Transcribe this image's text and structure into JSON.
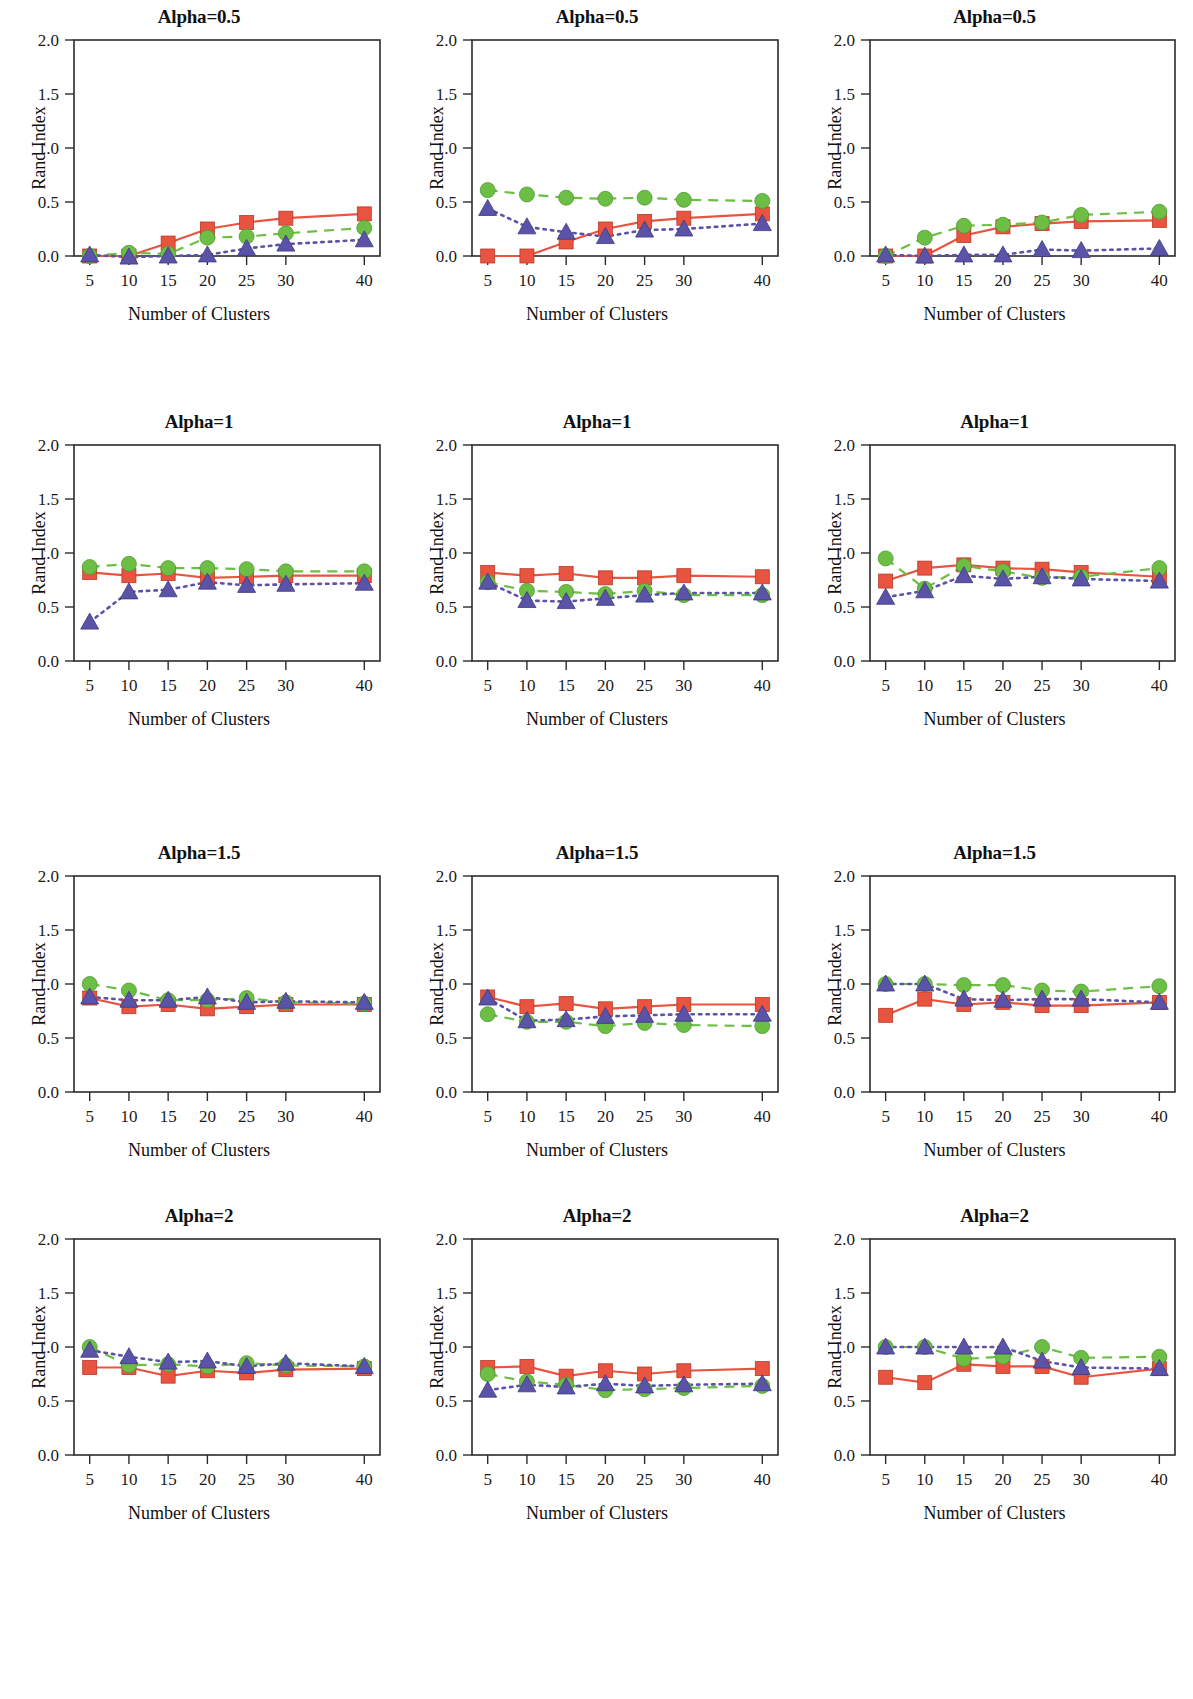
{
  "figure": {
    "axis": {
      "xlabel": "Number of Clusters",
      "ylabel": "Rand Index",
      "x_ticks": [
        "5",
        "10",
        "15",
        "20",
        "25",
        "30",
        "40"
      ],
      "y_ticks": [
        "0.0",
        "0.5",
        "1.0",
        "1.5",
        "2.0"
      ],
      "xlim": [
        3,
        42
      ],
      "ylim": [
        0.0,
        2.0
      ]
    },
    "series_style": {
      "orange": {
        "name": "orange-square-series",
        "color": "#E8543F",
        "marker": "square",
        "line": "solid"
      },
      "green": {
        "name": "green-circle-series",
        "color": "#6DBE45",
        "marker": "circle",
        "line": "dashed"
      },
      "blue": {
        "name": "blue-triangle-series",
        "color": "#5A53A8",
        "marker": "triangle",
        "line": "dotted"
      }
    }
  },
  "chart_data": [
    {
      "id": "r1c1",
      "type": "line",
      "title": "Alpha=0.5",
      "xlabel": "Number of Clusters",
      "ylabel": "Rand Index",
      "x": [
        5,
        10,
        15,
        20,
        25,
        30,
        40
      ],
      "xlim": [
        3,
        42
      ],
      "ylim": [
        0.0,
        2.0
      ],
      "grid": false,
      "legend": "none",
      "series": [
        {
          "name": "orange",
          "values": [
            0.0,
            0.0,
            0.12,
            0.25,
            0.31,
            0.35,
            0.39
          ]
        },
        {
          "name": "green",
          "values": [
            0.0,
            0.03,
            0.02,
            0.17,
            0.18,
            0.21,
            0.26
          ]
        },
        {
          "name": "blue",
          "values": [
            0.01,
            -0.01,
            0.0,
            0.01,
            0.07,
            0.11,
            0.15
          ]
        }
      ]
    },
    {
      "id": "r1c2",
      "type": "line",
      "title": "Alpha=0.5",
      "xlabel": "Number of Clusters",
      "ylabel": "Rand Index",
      "x": [
        5,
        10,
        15,
        20,
        25,
        30,
        40
      ],
      "xlim": [
        3,
        42
      ],
      "ylim": [
        0.0,
        2.0
      ],
      "grid": false,
      "legend": "none",
      "series": [
        {
          "name": "orange",
          "values": [
            0.0,
            0.0,
            0.13,
            0.25,
            0.32,
            0.35,
            0.39
          ]
        },
        {
          "name": "green",
          "values": [
            0.61,
            0.57,
            0.54,
            0.53,
            0.54,
            0.52,
            0.51
          ]
        },
        {
          "name": "blue",
          "values": [
            0.44,
            0.27,
            0.22,
            0.18,
            0.24,
            0.25,
            0.3
          ]
        }
      ]
    },
    {
      "id": "r1c3",
      "type": "line",
      "title": "Alpha=0.5",
      "xlabel": "Number of Clusters",
      "ylabel": "Rand Index",
      "x": [
        5,
        10,
        15,
        20,
        25,
        30,
        40
      ],
      "xlim": [
        3,
        42
      ],
      "ylim": [
        0.0,
        2.0
      ],
      "grid": false,
      "legend": "none",
      "series": [
        {
          "name": "orange",
          "values": [
            0.0,
            0.0,
            0.19,
            0.27,
            0.3,
            0.32,
            0.33
          ]
        },
        {
          "name": "green",
          "values": [
            0.0,
            0.17,
            0.28,
            0.29,
            0.31,
            0.38,
            0.41
          ]
        },
        {
          "name": "blue",
          "values": [
            0.01,
            0.0,
            0.01,
            0.01,
            0.06,
            0.05,
            0.07
          ]
        }
      ]
    },
    {
      "id": "r2c1",
      "type": "line",
      "title": "Alpha=1",
      "xlabel": "Number of Clusters",
      "ylabel": "Rand Index",
      "x": [
        5,
        10,
        15,
        20,
        25,
        30,
        40
      ],
      "xlim": [
        3,
        42
      ],
      "ylim": [
        0.0,
        2.0
      ],
      "grid": false,
      "legend": "none",
      "series": [
        {
          "name": "orange",
          "values": [
            0.82,
            0.79,
            0.81,
            0.77,
            0.78,
            0.79,
            0.79
          ]
        },
        {
          "name": "green",
          "values": [
            0.87,
            0.9,
            0.86,
            0.86,
            0.85,
            0.83,
            0.83
          ]
        },
        {
          "name": "blue",
          "values": [
            0.36,
            0.64,
            0.66,
            0.73,
            0.7,
            0.71,
            0.72
          ]
        }
      ]
    },
    {
      "id": "r2c2",
      "type": "line",
      "title": "Alpha=1",
      "xlabel": "Number of Clusters",
      "ylabel": "Rand Index",
      "x": [
        5,
        10,
        15,
        20,
        25,
        30,
        40
      ],
      "xlim": [
        3,
        42
      ],
      "ylim": [
        0.0,
        2.0
      ],
      "grid": false,
      "legend": "none",
      "series": [
        {
          "name": "orange",
          "values": [
            0.82,
            0.79,
            0.81,
            0.77,
            0.77,
            0.79,
            0.78
          ]
        },
        {
          "name": "green",
          "values": [
            0.73,
            0.65,
            0.64,
            0.62,
            0.65,
            0.61,
            0.61
          ]
        },
        {
          "name": "blue",
          "values": [
            0.73,
            0.56,
            0.55,
            0.58,
            0.61,
            0.63,
            0.63
          ]
        }
      ]
    },
    {
      "id": "r2c3",
      "type": "line",
      "title": "Alpha=1",
      "xlabel": "Number of Clusters",
      "ylabel": "Rand Index",
      "x": [
        5,
        10,
        15,
        20,
        25,
        30,
        40
      ],
      "xlim": [
        3,
        42
      ],
      "ylim": [
        0.0,
        2.0
      ],
      "grid": false,
      "legend": "none",
      "series": [
        {
          "name": "orange",
          "values": [
            0.74,
            0.86,
            0.89,
            0.86,
            0.85,
            0.82,
            0.78
          ]
        },
        {
          "name": "green",
          "values": [
            0.95,
            0.67,
            0.88,
            0.83,
            0.77,
            0.78,
            0.86
          ]
        },
        {
          "name": "blue",
          "values": [
            0.59,
            0.65,
            0.79,
            0.76,
            0.78,
            0.76,
            0.74
          ]
        }
      ]
    },
    {
      "id": "r3c1",
      "type": "line",
      "title": "Alpha=1.5",
      "xlabel": "Number of Clusters",
      "ylabel": "Rand Index",
      "x": [
        5,
        10,
        15,
        20,
        25,
        30,
        40
      ],
      "xlim": [
        3,
        42
      ],
      "ylim": [
        0.0,
        2.0
      ],
      "grid": false,
      "legend": "none",
      "series": [
        {
          "name": "orange",
          "values": [
            0.87,
            0.79,
            0.81,
            0.77,
            0.79,
            0.81,
            0.81
          ]
        },
        {
          "name": "green",
          "values": [
            1.0,
            0.94,
            0.85,
            0.85,
            0.87,
            0.83,
            0.82
          ]
        },
        {
          "name": "blue",
          "values": [
            0.88,
            0.85,
            0.85,
            0.88,
            0.83,
            0.84,
            0.83
          ]
        }
      ]
    },
    {
      "id": "r3c2",
      "type": "line",
      "title": "Alpha=1.5",
      "xlabel": "Number of Clusters",
      "ylabel": "Rand Index",
      "x": [
        5,
        10,
        15,
        20,
        25,
        30,
        40
      ],
      "xlim": [
        3,
        42
      ],
      "ylim": [
        0.0,
        2.0
      ],
      "grid": false,
      "legend": "none",
      "series": [
        {
          "name": "orange",
          "values": [
            0.88,
            0.79,
            0.82,
            0.77,
            0.79,
            0.81,
            0.81
          ]
        },
        {
          "name": "green",
          "values": [
            0.72,
            0.65,
            0.65,
            0.61,
            0.64,
            0.62,
            0.61
          ]
        },
        {
          "name": "blue",
          "values": [
            0.87,
            0.66,
            0.67,
            0.7,
            0.71,
            0.72,
            0.72
          ]
        }
      ]
    },
    {
      "id": "r3c3",
      "type": "line",
      "title": "Alpha=1.5",
      "xlabel": "Number of Clusters",
      "ylabel": "Rand Index",
      "x": [
        5,
        10,
        15,
        20,
        25,
        30,
        40
      ],
      "xlim": [
        3,
        42
      ],
      "ylim": [
        0.0,
        2.0
      ],
      "grid": false,
      "legend": "none",
      "series": [
        {
          "name": "orange",
          "values": [
            0.71,
            0.86,
            0.81,
            0.83,
            0.8,
            0.8,
            0.83
          ]
        },
        {
          "name": "green",
          "values": [
            1.0,
            1.0,
            0.99,
            0.99,
            0.94,
            0.93,
            0.98
          ]
        },
        {
          "name": "blue",
          "values": [
            1.0,
            1.0,
            0.86,
            0.85,
            0.86,
            0.86,
            0.83
          ]
        }
      ]
    },
    {
      "id": "r4c1",
      "type": "line",
      "title": "Alpha=2",
      "xlabel": "Number of Clusters",
      "ylabel": "Rand Index",
      "x": [
        5,
        10,
        15,
        20,
        25,
        30,
        40
      ],
      "xlim": [
        3,
        42
      ],
      "ylim": [
        0.0,
        2.0
      ],
      "grid": false,
      "legend": "none",
      "series": [
        {
          "name": "orange",
          "values": [
            0.81,
            0.81,
            0.73,
            0.78,
            0.76,
            0.79,
            0.8
          ]
        },
        {
          "name": "green",
          "values": [
            1.0,
            0.83,
            0.84,
            0.82,
            0.85,
            0.83,
            0.82
          ]
        },
        {
          "name": "blue",
          "values": [
            0.97,
            0.91,
            0.86,
            0.87,
            0.82,
            0.85,
            0.82
          ]
        }
      ]
    },
    {
      "id": "r4c2",
      "type": "line",
      "title": "Alpha=2",
      "xlabel": "Number of Clusters",
      "ylabel": "Rand Index",
      "x": [
        5,
        10,
        15,
        20,
        25,
        30,
        40
      ],
      "xlim": [
        3,
        42
      ],
      "ylim": [
        0.0,
        2.0
      ],
      "grid": false,
      "legend": "none",
      "series": [
        {
          "name": "orange",
          "values": [
            0.81,
            0.82,
            0.73,
            0.78,
            0.75,
            0.78,
            0.8
          ]
        },
        {
          "name": "green",
          "values": [
            0.75,
            0.68,
            0.65,
            0.6,
            0.61,
            0.62,
            0.64
          ]
        },
        {
          "name": "blue",
          "values": [
            0.6,
            0.65,
            0.63,
            0.66,
            0.64,
            0.65,
            0.66
          ]
        }
      ]
    },
    {
      "id": "r4c3",
      "type": "line",
      "title": "Alpha=2",
      "xlabel": "Number of Clusters",
      "ylabel": "Rand Index",
      "x": [
        5,
        10,
        15,
        20,
        25,
        30,
        40
      ],
      "xlim": [
        3,
        42
      ],
      "ylim": [
        0.0,
        2.0
      ],
      "grid": false,
      "legend": "none",
      "series": [
        {
          "name": "orange",
          "values": [
            0.72,
            0.67,
            0.84,
            0.82,
            0.82,
            0.72,
            0.8
          ]
        },
        {
          "name": "green",
          "values": [
            1.0,
            1.0,
            0.89,
            0.91,
            1.0,
            0.9,
            0.91
          ]
        },
        {
          "name": "blue",
          "values": [
            1.0,
            1.0,
            1.0,
            1.0,
            0.87,
            0.81,
            0.8
          ]
        }
      ]
    }
  ]
}
